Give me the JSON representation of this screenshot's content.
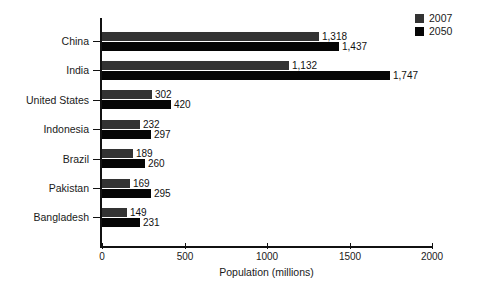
{
  "chart_data": {
    "type": "bar",
    "orientation": "horizontal",
    "title": "",
    "xlabel": "Population (millions)",
    "ylabel": "",
    "xlim": [
      0,
      2000
    ],
    "xticks": [
      0,
      500,
      1000,
      1500,
      2000
    ],
    "xtick_labels": [
      "0",
      "500",
      "1000",
      "1500",
      "2000"
    ],
    "grid": false,
    "legend_position": "top-right",
    "categories": [
      "China",
      "India",
      "United States",
      "Indonesia",
      "Brazil",
      "Pakistan",
      "Bangladesh"
    ],
    "series": [
      {
        "name": "2007",
        "color": "#333333",
        "values": [
          1318,
          1132,
          302,
          232,
          189,
          169,
          149
        ],
        "labels": [
          "1,318",
          "1,132",
          "302",
          "232",
          "189",
          "169",
          "149"
        ]
      },
      {
        "name": "2050",
        "color": "#050505",
        "values": [
          1437,
          1747,
          420,
          297,
          260,
          295,
          231
        ],
        "labels": [
          "1,437",
          "1,747",
          "420",
          "297",
          "260",
          "295",
          "231"
        ]
      }
    ]
  },
  "legend": {
    "entries": [
      {
        "label": "2007",
        "color": "#333333"
      },
      {
        "label": "2050",
        "color": "#050505"
      }
    ]
  },
  "colors": {
    "background": "#ffffff",
    "axis": "#111111",
    "text": "#1a1a1a",
    "series_2007": "#333333",
    "series_2050": "#050505"
  }
}
